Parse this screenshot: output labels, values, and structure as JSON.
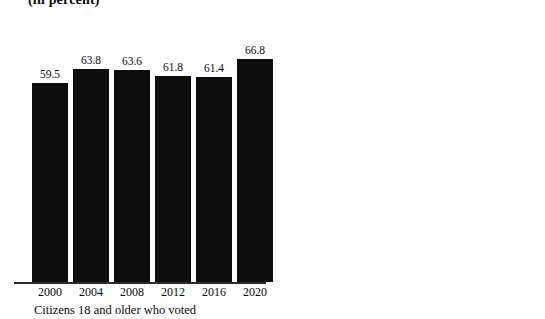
{
  "chart_data": {
    "type": "bar",
    "title": "(in percent)",
    "xlabel": "",
    "ylabel": "",
    "ylim": [
      0,
      80
    ],
    "grid": false,
    "legend_position": "none",
    "categories": [
      "2000",
      "2004",
      "2008",
      "2012",
      "2016",
      "2020"
    ],
    "panels": [
      {
        "caption": "Citizens 18 and older who voted",
        "color": "#0d0d0d",
        "values": [
          59.5,
          63.8,
          63.6,
          61.8,
          61.4,
          66.8
        ],
        "value_labels": [
          "59.5",
          "63.8",
          "63.6",
          "61.8",
          "61.4",
          "66.8"
        ]
      },
      {
        "caption": "Citizens 18 and older who registered to vote",
        "color": "#7f7f7f",
        "values": [
          69.5,
          72.1,
          71.0,
          71.2,
          70.3,
          72.7
        ],
        "value_labels": [
          "69.5",
          "72.1",
          "71.0",
          "71.2",
          "70.3",
          "72.7"
        ]
      }
    ]
  },
  "title": {
    "text": "(in percent)"
  },
  "left_panel": {
    "caption": "Citizens 18 and older who voted",
    "bars": [
      {
        "year": "2000",
        "value_label": "59.5"
      },
      {
        "year": "2004",
        "value_label": "63.8"
      },
      {
        "year": "2008",
        "value_label": "63.6"
      },
      {
        "year": "2012",
        "value_label": "61.8"
      },
      {
        "year": "2016",
        "value_label": "61.4"
      },
      {
        "year": "2020",
        "value_label": "66.8"
      }
    ]
  },
  "right_panel": {
    "caption": "Citizens 18 and older who registered to vote",
    "bars": [
      {
        "year": "2000",
        "value_label": "69.5"
      },
      {
        "year": "2004",
        "value_label": "72.1"
      },
      {
        "year": "2008",
        "value_label": "71.0"
      },
      {
        "year": "2012",
        "value_label": "71.2"
      },
      {
        "year": "2016",
        "value_label": "70.3"
      },
      {
        "year": "2020",
        "value_label": "72.7"
      }
    ]
  }
}
